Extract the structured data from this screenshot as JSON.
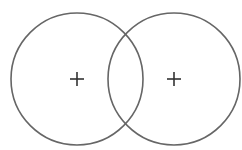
{
  "diagram": {
    "type": "two-overlapping-circles",
    "stroke_color": "#666666",
    "marker_color": "#333333",
    "background": "#ffffff",
    "circles": [
      {
        "name": "left-circle",
        "cx": 77,
        "cy": 79,
        "r": 66,
        "marker": "+"
      },
      {
        "name": "right-circle",
        "cx": 174,
        "cy": 79,
        "r": 66,
        "marker": "+"
      }
    ]
  }
}
